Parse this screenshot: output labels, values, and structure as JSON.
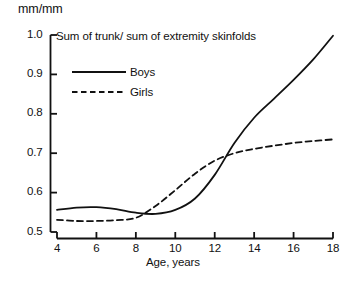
{
  "chart_data": {
    "type": "line",
    "title": "Sum of trunk/ sum of extremity skinfolds",
    "xlabel": "Age, years",
    "ylabel": "mm/mm",
    "grid": false,
    "legend_position": "top-left",
    "xlim": [
      4,
      18
    ],
    "ylim": [
      0.5,
      1.0
    ],
    "x_ticks": [
      4,
      6,
      8,
      10,
      12,
      14,
      16,
      18
    ],
    "x_tick_labels": [
      "4",
      "6",
      "8",
      "10",
      "12",
      "14",
      "16",
      "18"
    ],
    "y_ticks": [
      0.5,
      0.6,
      0.7,
      0.8,
      0.9,
      1.0
    ],
    "y_tick_labels": [
      "0.5",
      "0.6",
      "0.7",
      "0.8",
      "0.9",
      "1.0"
    ],
    "x": [
      4,
      5,
      6,
      7,
      8,
      9,
      10,
      11,
      12,
      13,
      14,
      15,
      16,
      17,
      18
    ],
    "series": [
      {
        "name": "Boys",
        "style": "solid",
        "color": "#111111",
        "values": [
          0.556,
          0.562,
          0.563,
          0.558,
          0.549,
          0.546,
          0.556,
          0.585,
          0.645,
          0.726,
          0.79,
          0.838,
          0.886,
          0.938,
          0.998
        ]
      },
      {
        "name": "Girls",
        "style": "dashed",
        "color": "#111111",
        "values": [
          0.531,
          0.528,
          0.528,
          0.53,
          0.536,
          0.566,
          0.606,
          0.648,
          0.681,
          0.7,
          0.711,
          0.719,
          0.726,
          0.731,
          0.735
        ]
      }
    ]
  },
  "legend": {
    "boys_label": "Boys",
    "girls_label": "Girls"
  },
  "axes": {
    "y_unit": "mm/mm",
    "x_title": "Age, years"
  }
}
